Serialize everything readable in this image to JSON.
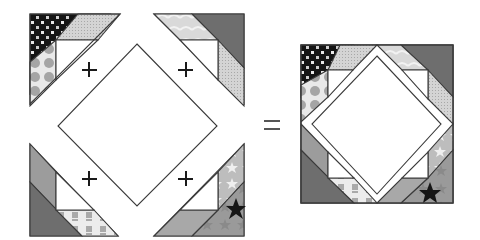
{
  "diagram": {
    "type": "quilt-block-assembly",
    "operators": {
      "plus": "+",
      "equals": "="
    },
    "pieces": {
      "center": {
        "shape": "square-on-point",
        "fill": "white"
      },
      "corner_units": [
        {
          "position": "top-left",
          "fabrics": [
            "black-dotted-print",
            "light-gray-dotted",
            "gray-circle-print",
            "white"
          ]
        },
        {
          "position": "top-right",
          "fabrics": [
            "dark-gray",
            "light-marbled",
            "light-gray-dotted",
            "white"
          ]
        },
        {
          "position": "bottom-left",
          "fabrics": [
            "dark-gray",
            "medium-gray",
            "light-line-print",
            "white"
          ]
        },
        {
          "position": "bottom-right",
          "fabrics": [
            "star-print",
            "medium-gray",
            "light-star-print",
            "white"
          ]
        }
      ]
    },
    "colors": {
      "outline": "#3a3a3a",
      "black_print": "#151515",
      "dark_gray": "#6e6e6e",
      "medium_gray": "#9c9c9c",
      "light_gray": "#cfcfcf",
      "very_light": "#e6e6e6",
      "white": "#ffffff"
    },
    "result": {
      "label": "finished-block"
    }
  }
}
